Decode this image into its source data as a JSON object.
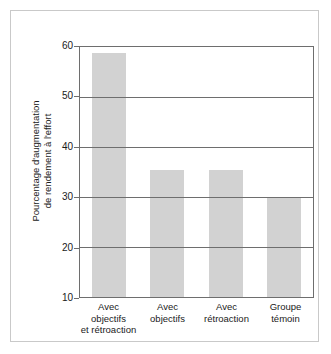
{
  "chart_data": {
    "type": "bar",
    "title": "",
    "subtitle": "",
    "xlabel": "",
    "ylabel_lines": [
      "Pourcentage d'augmentation",
      "de rendement à l'effort"
    ],
    "ylabel": "Pourcentage d'augmentation de rendement à l'effort",
    "categories": [
      "Avec objectifs et rétroaction",
      "Avec objectifs",
      "Avec rétroaction",
      "Groupe témoin"
    ],
    "category_lines": [
      [
        "Avec",
        "objectifs",
        "et rétroaction"
      ],
      [
        "Avec",
        "objectifs"
      ],
      [
        "Avec",
        "rétroaction"
      ],
      [
        "Groupe",
        "témoin"
      ]
    ],
    "values": [
      58.8,
      35.5,
      35.4,
      29.8
    ],
    "ylim": [
      10,
      60
    ],
    "yticks": [
      10,
      20,
      30,
      40,
      50,
      60
    ],
    "ytick_labels": [
      "10",
      "20",
      "30",
      "40",
      "50",
      "60"
    ],
    "grid": true,
    "grid_axis": "y",
    "legend": false,
    "bar_color": "#d2d2d2",
    "axis_color": "#6e6e6e",
    "text_color": "#1a1a1a",
    "frame_color": "#c9c9c9",
    "background": "#ffffff"
  }
}
